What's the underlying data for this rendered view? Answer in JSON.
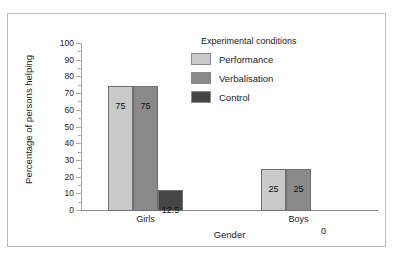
{
  "cropped_text_above": "· ·                         ·",
  "chart_data": {
    "type": "bar",
    "title": "",
    "xlabel": "Gender",
    "ylabel": "Percentage of persons helping",
    "categories": [
      "Girls",
      "Boys"
    ],
    "series": [
      {
        "name": "Performance",
        "values": [
          75,
          25
        ],
        "color": "#c9c9c9"
      },
      {
        "name": "Verbalisation",
        "values": [
          75,
          25
        ],
        "color": "#8a8a8a"
      },
      {
        "name": "Control",
        "values": [
          12.5,
          0
        ],
        "color": "#454545"
      }
    ],
    "value_labels": {
      "Girls": [
        "75",
        "75",
        "12.5"
      ],
      "Boys": [
        "25",
        "25",
        "0"
      ]
    },
    "ylim": [
      0,
      100
    ],
    "ytick_step": 10,
    "yminor_step": 5,
    "ytick_labels": [
      "0",
      "10",
      "20",
      "30",
      "40",
      "50",
      "60",
      "70",
      "80",
      "90",
      "100"
    ],
    "grid": false,
    "legend_position": "top-right",
    "legend_title": "Experimental conditions"
  },
  "legend": {
    "title": "Experimental conditions",
    "entries": [
      {
        "label": "Performance",
        "swatch": "#c9c9c9"
      },
      {
        "label": "Verbalisation",
        "swatch": "#8a8a8a"
      },
      {
        "label": "Control",
        "swatch": "#454545"
      }
    ]
  }
}
